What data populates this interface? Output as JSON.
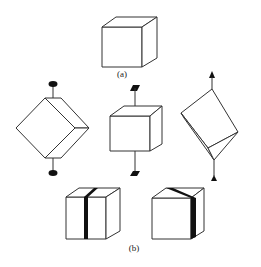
{
  "figure": {
    "part_a": {
      "label": "(a)",
      "description": "Plain cube"
    },
    "part_b": {
      "label": "(b)",
      "row1": [
        {
          "description": "Cube rotated 45 degrees about vertical axis with oval (disc) markers top and bottom",
          "marker": "ellipse"
        },
        {
          "description": "Upright cube with flag (parallelogram) markers top and bottom",
          "marker": "parallelogram"
        },
        {
          "description": "Cube tilted about diagonal axis with triangle (arrow) markers top and bottom",
          "marker": "triangle"
        }
      ],
      "row2": [
        {
          "description": "Cube with black vertical band on front face and top",
          "marker": "band"
        },
        {
          "description": "Cube with black band across top and right edge",
          "marker": "band"
        }
      ]
    },
    "colors": {
      "stroke": "#333333",
      "band": "#111111",
      "background": "#ffffff"
    }
  }
}
